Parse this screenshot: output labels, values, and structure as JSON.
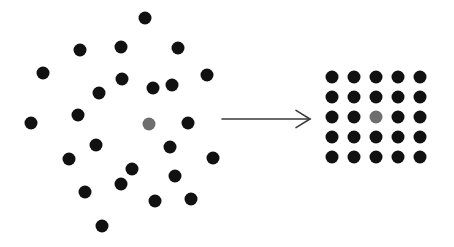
{
  "canvas": {
    "width": 454,
    "height": 247,
    "background_color": "#ffffff"
  },
  "colors": {
    "dot_default": "#111111",
    "dot_highlight": "#6e6e6e",
    "arrow": "#3a3a3a"
  },
  "left_group": {
    "label": "random-scatter-cluster",
    "dot_radius": 6.5,
    "dot_count": 27,
    "dots": [
      {
        "x": 145,
        "y": 18,
        "color": "#111111",
        "highlight": false
      },
      {
        "x": 80,
        "y": 50,
        "color": "#111111",
        "highlight": false
      },
      {
        "x": 121,
        "y": 47,
        "color": "#111111",
        "highlight": false
      },
      {
        "x": 178,
        "y": 48,
        "color": "#111111",
        "highlight": false
      },
      {
        "x": 43,
        "y": 73,
        "color": "#111111",
        "highlight": false
      },
      {
        "x": 122,
        "y": 79,
        "color": "#111111",
        "highlight": false
      },
      {
        "x": 207,
        "y": 75,
        "color": "#111111",
        "highlight": false
      },
      {
        "x": 153,
        "y": 88,
        "color": "#111111",
        "highlight": false
      },
      {
        "x": 172,
        "y": 85,
        "color": "#111111",
        "highlight": false
      },
      {
        "x": 99,
        "y": 93,
        "color": "#111111",
        "highlight": false
      },
      {
        "x": 78,
        "y": 115,
        "color": "#111111",
        "highlight": false
      },
      {
        "x": 31,
        "y": 123,
        "color": "#111111",
        "highlight": false
      },
      {
        "x": 149,
        "y": 124,
        "color": "#6e6e6e",
        "highlight": true
      },
      {
        "x": 188,
        "y": 123,
        "color": "#111111",
        "highlight": false
      },
      {
        "x": 96,
        "y": 145,
        "color": "#111111",
        "highlight": false
      },
      {
        "x": 170,
        "y": 147,
        "color": "#111111",
        "highlight": false
      },
      {
        "x": 69,
        "y": 159,
        "color": "#111111",
        "highlight": false
      },
      {
        "x": 213,
        "y": 158,
        "color": "#111111",
        "highlight": false
      },
      {
        "x": 132,
        "y": 169,
        "color": "#111111",
        "highlight": false
      },
      {
        "x": 175,
        "y": 176,
        "color": "#111111",
        "highlight": false
      },
      {
        "x": 121,
        "y": 184,
        "color": "#111111",
        "highlight": false
      },
      {
        "x": 85,
        "y": 192,
        "color": "#111111",
        "highlight": false
      },
      {
        "x": 155,
        "y": 201,
        "color": "#111111",
        "highlight": false
      },
      {
        "x": 191,
        "y": 199,
        "color": "#111111",
        "highlight": false
      },
      {
        "x": 102,
        "y": 226,
        "color": "#111111",
        "highlight": false
      }
    ]
  },
  "arrow": {
    "label": "transformation-arrow",
    "x1": 222,
    "y1": 119,
    "x2": 310,
    "y2": 119,
    "color": "#3a3a3a",
    "stroke_width": 1.6,
    "head_size": 14
  },
  "right_group": {
    "label": "ordered-grid-lattice",
    "dot_radius": 6.5,
    "rows": 5,
    "columns": 5,
    "dot_count": 25,
    "origin_x": 332,
    "origin_y": 77,
    "spacing_x": 22,
    "spacing_y": 20,
    "highlight_row": 3,
    "highlight_column": 3,
    "dots": [
      {
        "x": 332,
        "y": 77,
        "color": "#111111",
        "highlight": false
      },
      {
        "x": 354,
        "y": 77,
        "color": "#111111",
        "highlight": false
      },
      {
        "x": 376,
        "y": 77,
        "color": "#111111",
        "highlight": false
      },
      {
        "x": 398,
        "y": 77,
        "color": "#111111",
        "highlight": false
      },
      {
        "x": 420,
        "y": 77,
        "color": "#111111",
        "highlight": false
      },
      {
        "x": 332,
        "y": 97,
        "color": "#111111",
        "highlight": false
      },
      {
        "x": 354,
        "y": 97,
        "color": "#111111",
        "highlight": false
      },
      {
        "x": 376,
        "y": 97,
        "color": "#111111",
        "highlight": false
      },
      {
        "x": 398,
        "y": 97,
        "color": "#111111",
        "highlight": false
      },
      {
        "x": 420,
        "y": 97,
        "color": "#111111",
        "highlight": false
      },
      {
        "x": 332,
        "y": 117,
        "color": "#111111",
        "highlight": false
      },
      {
        "x": 354,
        "y": 117,
        "color": "#111111",
        "highlight": false
      },
      {
        "x": 376,
        "y": 117,
        "color": "#6e6e6e",
        "highlight": true
      },
      {
        "x": 398,
        "y": 117,
        "color": "#111111",
        "highlight": false
      },
      {
        "x": 420,
        "y": 117,
        "color": "#111111",
        "highlight": false
      },
      {
        "x": 332,
        "y": 137,
        "color": "#111111",
        "highlight": false
      },
      {
        "x": 354,
        "y": 137,
        "color": "#111111",
        "highlight": false
      },
      {
        "x": 376,
        "y": 137,
        "color": "#111111",
        "highlight": false
      },
      {
        "x": 398,
        "y": 137,
        "color": "#111111",
        "highlight": false
      },
      {
        "x": 420,
        "y": 137,
        "color": "#111111",
        "highlight": false
      },
      {
        "x": 332,
        "y": 157,
        "color": "#111111",
        "highlight": false
      },
      {
        "x": 354,
        "y": 157,
        "color": "#111111",
        "highlight": false
      },
      {
        "x": 376,
        "y": 157,
        "color": "#111111",
        "highlight": false
      },
      {
        "x": 398,
        "y": 157,
        "color": "#111111",
        "highlight": false
      },
      {
        "x": 420,
        "y": 157,
        "color": "#111111",
        "highlight": false
      }
    ]
  }
}
